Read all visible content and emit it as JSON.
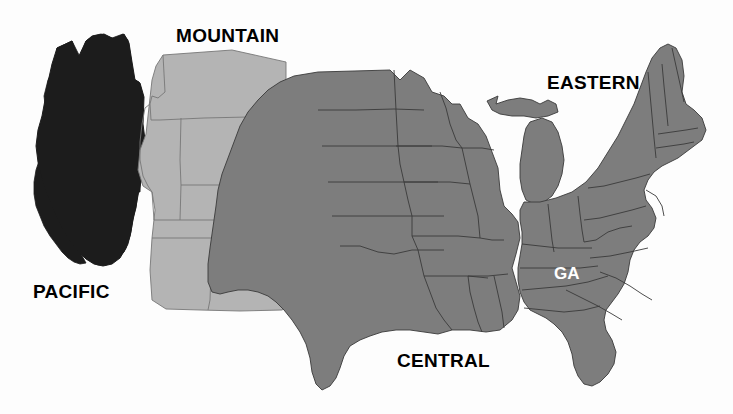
{
  "map": {
    "title": "United States Time Zones",
    "background_color": "#fdfdfd",
    "width": 733,
    "height": 414,
    "boundary_color": "#2b2b2b"
  },
  "zones": [
    {
      "id": "pacific",
      "label": "PACIFIC",
      "fill": "#1c1c1c",
      "label_color": "#000000",
      "label_x": 33,
      "label_y": 281,
      "states": [
        "WA",
        "OR",
        "CA",
        "NV"
      ]
    },
    {
      "id": "mountain",
      "label": "MOUNTAIN",
      "fill": "#b4b4b4",
      "label_color": "#000000",
      "label_x": 176,
      "label_y": 25,
      "states": [
        "MT",
        "ID",
        "WY",
        "UT",
        "CO",
        "AZ",
        "NM"
      ]
    },
    {
      "id": "central",
      "label": "CENTRAL",
      "fill": "#7d7d7d",
      "label_color": "#000000",
      "label_x": 397,
      "label_y": 350,
      "states": [
        "ND",
        "SD",
        "NE",
        "KS",
        "OK",
        "TX",
        "MN",
        "IA",
        "MO",
        "AR",
        "LA",
        "WI",
        "IL",
        "MS",
        "AL",
        "TN"
      ]
    },
    {
      "id": "eastern",
      "label": "EASTERN",
      "fill": "#7d7d7d",
      "label_color": "#000000",
      "label_x": 547,
      "label_y": 72,
      "states": [
        "MI",
        "IN",
        "OH",
        "KY",
        "WV",
        "VA",
        "NC",
        "SC",
        "GA",
        "FL",
        "PA",
        "NY",
        "VT",
        "NH",
        "ME",
        "MA",
        "RI",
        "CT",
        "NJ",
        "DE",
        "MD"
      ]
    }
  ],
  "state_labels": [
    {
      "id": "ga",
      "label": "GA",
      "color": "#ffffff",
      "x": 554,
      "y": 264,
      "zone": "eastern"
    }
  ]
}
